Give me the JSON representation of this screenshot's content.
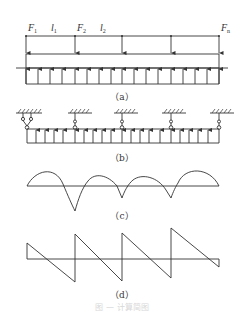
{
  "figure": {
    "panel_a": {
      "caption": "（a）",
      "labels": [
        {
          "main": "F",
          "sub": "1"
        },
        {
          "main": "l",
          "sub": "1"
        },
        {
          "main": "F",
          "sub": "2"
        },
        {
          "main": "l",
          "sub": "2"
        },
        {
          "main": "F",
          "sub": "n"
        }
      ]
    },
    "panel_b": {
      "caption": "（b）"
    },
    "panel_c": {
      "caption": "（c）"
    },
    "panel_d": {
      "caption": "（d）"
    },
    "footer_caption": "图 — 计算简图"
  },
  "colors": {
    "line": "#333333",
    "background": "#ffffff"
  }
}
